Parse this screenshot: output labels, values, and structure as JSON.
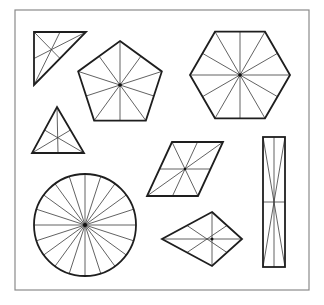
{
  "figure": {
    "frame": {
      "x": 15,
      "y": 10,
      "width": 294,
      "height": 280,
      "color": "#8a8a8a"
    },
    "colors": {
      "outline": "#1e1e1e",
      "symmetry_line": "#3a3a3a",
      "background": "#ffffff"
    },
    "shapes": [
      {
        "id": "right-triangle",
        "type": "polygon",
        "points": [
          [
            34,
            32
          ],
          [
            86,
            32
          ],
          [
            34,
            85
          ]
        ],
        "symmetry_lines": [
          [
            [
              34,
              32
            ],
            [
              60,
              58
            ]
          ],
          [
            [
              86,
              32
            ],
            [
              34,
              58
            ]
          ],
          [
            [
              34,
              85
            ],
            [
              60,
              32
            ]
          ]
        ]
      },
      {
        "id": "pentagon",
        "type": "regular-polygon",
        "sides": 5,
        "center": [
          120,
          85
        ],
        "radius": 44,
        "rotation": -90,
        "symmetry_lines": 5
      },
      {
        "id": "hexagon",
        "type": "regular-polygon",
        "sides": 6,
        "center": [
          240,
          75
        ],
        "radius": 50,
        "rotation": 0,
        "symmetry_lines": 6
      },
      {
        "id": "equilateral-triangle",
        "type": "polygon",
        "points": [
          [
            57,
            107
          ],
          [
            84,
            153
          ],
          [
            32,
            153
          ]
        ],
        "symmetry_lines": 3
      },
      {
        "id": "parallelogram",
        "type": "polygon",
        "points": [
          [
            172,
            142
          ],
          [
            223,
            142
          ],
          [
            198,
            196
          ],
          [
            147,
            196
          ]
        ],
        "center": [
          185,
          169
        ]
      },
      {
        "id": "circle",
        "type": "circle",
        "center": [
          85,
          225
        ],
        "radius": 51,
        "spokes": 20
      },
      {
        "id": "kite",
        "type": "polygon",
        "points": [
          [
            212,
            212
          ],
          [
            242,
            239
          ],
          [
            212,
            266
          ],
          [
            162,
            239
          ]
        ],
        "center": [
          212,
          239
        ]
      },
      {
        "id": "rectangle",
        "type": "rect",
        "x": 263,
        "y": 137,
        "width": 22,
        "height": 130
      }
    ]
  }
}
